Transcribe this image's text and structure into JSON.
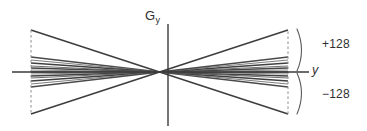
{
  "figure": {
    "background_color": "#ffffff",
    "width": 367,
    "height": 131,
    "axes": {
      "vertical": {
        "label_main": "G",
        "label_sub": "y",
        "name": "gradient-amplitude-axis",
        "x": 168,
        "y_top": 24,
        "y_bottom": 126,
        "color": "#3a3a3a"
      },
      "horizontal": {
        "label": "y",
        "name": "time-axis",
        "y": 72,
        "x_left": 12,
        "x_right": 309,
        "color": "#3a3a3a"
      }
    },
    "annotations": {
      "upper_label": "+128",
      "lower_label": "−128",
      "upper_brace_name": "positive-amplitude-brace",
      "lower_brace_name": "negative-amplitude-brace",
      "label_color": "#2e2e2e"
    },
    "dashed_edges": {
      "left_x": 31,
      "right_x": 288,
      "color": "#8d8d8d"
    },
    "crossing_point": {
      "x": 168,
      "y": 72
    }
  },
  "chart_data": {
    "type": "line",
    "xlabel": "y",
    "ylabel": "G_y",
    "grid": false,
    "legend": null,
    "xlim": [
      12,
      309
    ],
    "ylim": [
      -128,
      128
    ],
    "annotations": [
      "+128",
      "−128"
    ],
    "crossing_x": 168,
    "left_edge_x": 31,
    "right_edge_x": 288,
    "baseline_y": 72,
    "series": [
      {
        "name": "step_+128",
        "left_y": 30,
        "right_y": 114,
        "stroke": "#3d3d3d",
        "width": 1.5
      },
      {
        "name": "step_+96",
        "left_y": 57,
        "right_y": 87,
        "stroke": "#4a4a4a",
        "width": 1.3
      },
      {
        "name": "step_+80",
        "left_y": 60,
        "right_y": 84,
        "stroke": "#7f7f7f",
        "width": 1.1
      },
      {
        "name": "step_+64",
        "left_y": 63,
        "right_y": 81,
        "stroke": "#3f3f3f",
        "width": 1.4
      },
      {
        "name": "step_+48",
        "left_y": 66,
        "right_y": 78,
        "stroke": "#6e6e6e",
        "width": 1.1
      },
      {
        "name": "step_+32",
        "left_y": 68,
        "right_y": 76,
        "stroke": "#444444",
        "width": 1.3
      },
      {
        "name": "step_+16",
        "left_y": 70,
        "right_y": 74,
        "stroke": "#8a8a8a",
        "width": 1.0
      },
      {
        "name": "step_0",
        "left_y": 72,
        "right_y": 72,
        "stroke": "#3a3a3a",
        "width": 1.4
      },
      {
        "name": "step_-16",
        "left_y": 74,
        "right_y": 70,
        "stroke": "#8a8a8a",
        "width": 1.0
      },
      {
        "name": "step_-32",
        "left_y": 76,
        "right_y": 68,
        "stroke": "#444444",
        "width": 1.3
      },
      {
        "name": "step_-48",
        "left_y": 78,
        "right_y": 66,
        "stroke": "#6e6e6e",
        "width": 1.1
      },
      {
        "name": "step_-64",
        "left_y": 81,
        "right_y": 63,
        "stroke": "#3f3f3f",
        "width": 1.4
      },
      {
        "name": "step_-80",
        "left_y": 84,
        "right_y": 60,
        "stroke": "#7f7f7f",
        "width": 1.1
      },
      {
        "name": "step_-96",
        "left_y": 87,
        "right_y": 57,
        "stroke": "#4a4a4a",
        "width": 1.3
      },
      {
        "name": "step_-128",
        "left_y": 114,
        "right_y": 30,
        "stroke": "#3d3d3d",
        "width": 1.5
      }
    ]
  }
}
